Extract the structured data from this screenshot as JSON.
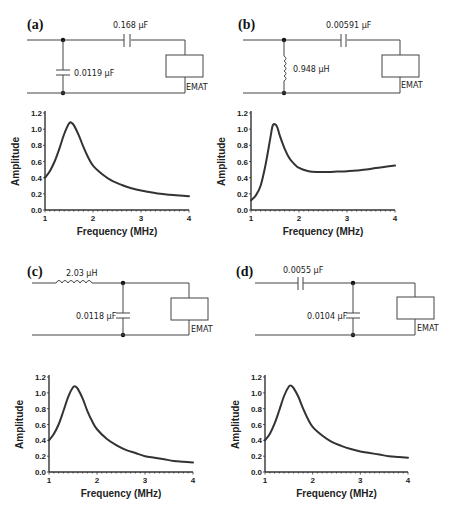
{
  "panels": [
    {
      "id": "a",
      "label": "(a)",
      "circuit": {
        "topology": "shunt-capacitor + series-capacitor",
        "series_component": {
          "type": "capacitor",
          "value": "0.168 µF"
        },
        "shunt_component": {
          "type": "capacitor",
          "value": "0.0119 µF"
        },
        "load_label": "EMAT"
      }
    },
    {
      "id": "b",
      "label": "(b)",
      "circuit": {
        "topology": "shunt-inductor + series-capacitor",
        "series_component": {
          "type": "capacitor",
          "value": "0.00591 µF"
        },
        "shunt_component": {
          "type": "inductor",
          "value": "0.948 µH"
        },
        "load_label": "EMAT"
      }
    },
    {
      "id": "c",
      "label": "(c)",
      "circuit": {
        "topology": "series-inductor + shunt-capacitor",
        "series_component": {
          "type": "inductor",
          "value": "2.03 µH"
        },
        "shunt_component": {
          "type": "capacitor",
          "value": "0.0118 µF"
        },
        "load_label": "EMAT"
      }
    },
    {
      "id": "d",
      "label": "(d)",
      "circuit": {
        "topology": "series-capacitor + shunt-capacitor",
        "series_component": {
          "type": "capacitor",
          "value": "0.0055 µF"
        },
        "shunt_component": {
          "type": "capacitor",
          "value": "0.0104 µF"
        },
        "load_label": "EMAT"
      }
    }
  ],
  "axes": {
    "xlabel": "Frequency (MHz)",
    "ylabel": "Amplitude",
    "xticks": [
      "1",
      "2",
      "3",
      "4"
    ],
    "yticks": [
      "0.0",
      "0.2",
      "0.4",
      "0.6",
      "0.8",
      "1.0",
      "1.2"
    ]
  },
  "chart_data": [
    {
      "panel": "a",
      "type": "line",
      "title": "",
      "xlabel": "Frequency (MHz)",
      "ylabel": "Amplitude",
      "xlim": [
        1,
        4
      ],
      "ylim": [
        0,
        1.2
      ],
      "grid": false,
      "x": [
        1.0,
        1.1,
        1.2,
        1.3,
        1.4,
        1.5,
        1.55,
        1.6,
        1.7,
        1.8,
        1.9,
        2.0,
        2.2,
        2.4,
        2.6,
        2.8,
        3.0,
        3.2,
        3.4,
        3.6,
        3.8,
        4.0
      ],
      "y": [
        0.4,
        0.48,
        0.6,
        0.76,
        0.94,
        1.07,
        1.08,
        1.05,
        0.93,
        0.78,
        0.65,
        0.55,
        0.44,
        0.36,
        0.31,
        0.27,
        0.24,
        0.22,
        0.2,
        0.19,
        0.18,
        0.17
      ]
    },
    {
      "panel": "b",
      "type": "line",
      "title": "",
      "xlabel": "Frequency (MHz)",
      "ylabel": "Amplitude",
      "xlim": [
        1,
        4
      ],
      "ylim": [
        0,
        1.2
      ],
      "grid": false,
      "x": [
        1.0,
        1.1,
        1.2,
        1.3,
        1.4,
        1.45,
        1.5,
        1.55,
        1.6,
        1.7,
        1.8,
        1.9,
        2.0,
        2.2,
        2.4,
        2.6,
        2.8,
        3.0,
        3.2,
        3.4,
        3.6,
        3.8,
        4.0
      ],
      "y": [
        0.12,
        0.18,
        0.3,
        0.55,
        0.88,
        1.04,
        1.06,
        1.02,
        0.92,
        0.76,
        0.64,
        0.57,
        0.52,
        0.48,
        0.47,
        0.47,
        0.475,
        0.48,
        0.49,
        0.5,
        0.52,
        0.535,
        0.55
      ]
    },
    {
      "panel": "c",
      "type": "line",
      "title": "",
      "xlabel": "Frequency (MHz)",
      "ylabel": "Amplitude",
      "xlim": [
        1,
        4
      ],
      "ylim": [
        0,
        1.2
      ],
      "grid": false,
      "x": [
        1.0,
        1.1,
        1.2,
        1.3,
        1.4,
        1.5,
        1.55,
        1.6,
        1.7,
        1.8,
        1.9,
        2.0,
        2.2,
        2.4,
        2.6,
        2.8,
        3.0,
        3.2,
        3.4,
        3.6,
        3.8,
        4.0
      ],
      "y": [
        0.4,
        0.48,
        0.6,
        0.77,
        0.95,
        1.07,
        1.08,
        1.05,
        0.93,
        0.77,
        0.64,
        0.54,
        0.42,
        0.34,
        0.28,
        0.24,
        0.2,
        0.18,
        0.16,
        0.14,
        0.13,
        0.12
      ]
    },
    {
      "panel": "d",
      "type": "line",
      "title": "",
      "xlabel": "Frequency (MHz)",
      "ylabel": "Amplitude",
      "xlim": [
        1,
        4
      ],
      "ylim": [
        0,
        1.2
      ],
      "grid": false,
      "x": [
        1.0,
        1.1,
        1.2,
        1.3,
        1.4,
        1.5,
        1.55,
        1.6,
        1.7,
        1.8,
        1.9,
        2.0,
        2.2,
        2.4,
        2.6,
        2.8,
        3.0,
        3.2,
        3.4,
        3.6,
        3.8,
        4.0
      ],
      "y": [
        0.4,
        0.48,
        0.61,
        0.78,
        0.96,
        1.08,
        1.09,
        1.06,
        0.95,
        0.8,
        0.67,
        0.57,
        0.46,
        0.38,
        0.33,
        0.29,
        0.26,
        0.24,
        0.22,
        0.2,
        0.19,
        0.18
      ]
    }
  ]
}
